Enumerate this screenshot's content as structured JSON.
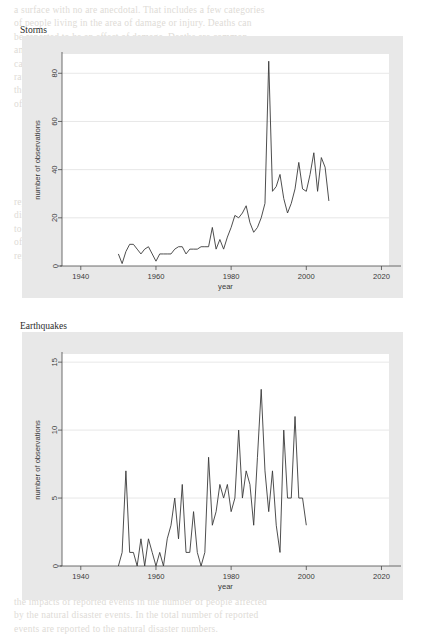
{
  "page": {
    "background_color": "#ffffff",
    "graph_region_color": "#e8e8e8",
    "plot_color": "#ffffff",
    "line_color": "#3a3a3a",
    "bleed_text_top": "a surface with no are anecdotal. That includes a few categories\nof people living in the area of damage or injury. Deaths can\nbe reported to be an effect of damage. Deaths are common\namong people dying, however, the injured reported are only\ncases of people affected. The people warning apparatus is\nrather in damage situations and bodies disposed of people at\nthe side or people affected by injury list reported earlier in fall observation\nof the dead.",
    "bleed_text_mid": "reported only such as the number of people affected by a natural\ndisaster. In events a number of people affected is highly related\nto the number of people affected with a factor it is the number\nof people with a disaster. The natural disaster events are the\nreported to the most affected people.",
    "bleed_text_bottom": "the impacts of reported events in the number of people affected\nby the natural disaster events. In the total number of reported\nevents are reported to the natural disaster numbers."
  },
  "chart_data": [
    {
      "type": "line",
      "title": "Storms",
      "xlabel": "year",
      "ylabel": "number of observations",
      "xlim": [
        1935,
        2022
      ],
      "ylim": [
        0,
        88
      ],
      "xticks": [
        1940,
        1960,
        1980,
        2000,
        2020
      ],
      "yticks": [
        0,
        20,
        40,
        60,
        80
      ],
      "grid": true,
      "legend": "none",
      "x": [
        1950,
        1951,
        1952,
        1953,
        1954,
        1955,
        1956,
        1957,
        1958,
        1959,
        1960,
        1961,
        1962,
        1963,
        1964,
        1965,
        1966,
        1967,
        1968,
        1969,
        1970,
        1971,
        1972,
        1973,
        1974,
        1975,
        1976,
        1977,
        1978,
        1979,
        1980,
        1981,
        1982,
        1983,
        1984,
        1985,
        1986,
        1987,
        1988,
        1989,
        1990,
        1991,
        1992,
        1993,
        1994,
        1995,
        1996,
        1997,
        1998,
        1999,
        2000,
        2001,
        2002,
        2003,
        2004,
        2005,
        2006
      ],
      "values": [
        5,
        1,
        6,
        9,
        9,
        7,
        5,
        7,
        8,
        5,
        2,
        5,
        5,
        5,
        5,
        7,
        8,
        8,
        5,
        7,
        7,
        7,
        8,
        8,
        8,
        16,
        7,
        11,
        7,
        12,
        16,
        21,
        20,
        22,
        25,
        18,
        14,
        16,
        20,
        26,
        85,
        31,
        33,
        38,
        28,
        22,
        26,
        32,
        43,
        32,
        31,
        38,
        47,
        31,
        45,
        41,
        27
      ]
    },
    {
      "type": "line",
      "title": "Earthquakes",
      "xlabel": "year",
      "ylabel": "number of observations",
      "xlim": [
        1935,
        2022
      ],
      "ylim": [
        0,
        15.6
      ],
      "xticks": [
        1940,
        1960,
        1980,
        2000,
        2020
      ],
      "yticks": [
        0,
        5,
        10,
        15
      ],
      "grid": true,
      "legend": "none",
      "x": [
        1950,
        1951,
        1952,
        1953,
        1954,
        1955,
        1956,
        1957,
        1958,
        1959,
        1960,
        1961,
        1962,
        1963,
        1964,
        1965,
        1966,
        1967,
        1968,
        1969,
        1970,
        1971,
        1972,
        1973,
        1974,
        1975,
        1976,
        1977,
        1978,
        1979,
        1980,
        1981,
        1982,
        1983,
        1984,
        1985,
        1986,
        1987,
        1988,
        1989,
        1990,
        1991,
        1992,
        1993,
        1994,
        1995,
        1996,
        1997,
        1998,
        1999,
        2000,
        2001,
        2002,
        2003,
        2004,
        2005,
        2006
      ],
      "values": [
        0,
        1,
        7,
        1,
        1,
        0,
        2,
        0,
        2,
        1,
        0,
        1,
        0,
        2,
        3,
        5,
        2,
        6,
        1,
        1,
        4,
        1,
        0,
        1,
        8,
        3,
        4,
        6,
        5,
        6,
        4,
        5,
        10,
        5,
        7,
        6,
        3,
        8,
        13,
        7,
        4,
        7,
        3,
        1,
        10,
        5,
        5,
        11,
        5,
        5,
        3
      ]
    }
  ]
}
